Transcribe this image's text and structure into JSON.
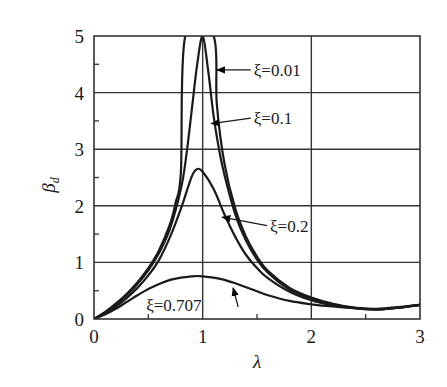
{
  "chart_data": {
    "type": "line",
    "title": "",
    "xlabel": "λ",
    "ylabel": "β_d",
    "xlim": [
      0,
      3
    ],
    "ylim": [
      0,
      5
    ],
    "x_ticks": [
      "0",
      "1",
      "2",
      "3"
    ],
    "y_ticks": [
      "0",
      "1",
      "2",
      "3",
      "4",
      "5"
    ],
    "x_minor_ticks": [
      0.5,
      1.5,
      2.5
    ],
    "y_minor_ticks": [
      0.5,
      1.5,
      2.5,
      3.5,
      4.5
    ],
    "grid": {
      "x": [
        1,
        2
      ],
      "y": [
        1,
        2,
        3,
        4
      ]
    },
    "legend_position": "inline annotations with arrows",
    "series": [
      {
        "name": "ξ=0.01",
        "x": [
          0,
          0.1,
          0.2,
          0.3,
          0.4,
          0.5,
          0.6,
          0.7,
          0.75,
          0.8,
          0.84,
          1.1,
          1.13,
          1.2,
          1.3,
          1.4,
          1.5,
          1.6,
          1.8,
          2.0,
          2.2,
          2.4,
          2.6,
          2.8,
          3.0
        ],
        "y": [
          0,
          0.12,
          0.27,
          0.44,
          0.65,
          0.9,
          1.22,
          1.68,
          2.05,
          2.6,
          5.0,
          5.0,
          3.8,
          2.75,
          1.95,
          1.45,
          1.1,
          0.85,
          0.55,
          0.38,
          0.27,
          0.2,
          0.17,
          0.2,
          0.25
        ]
      },
      {
        "name": "ξ=0.1",
        "x": [
          0,
          0.1,
          0.2,
          0.3,
          0.4,
          0.5,
          0.6,
          0.7,
          0.8,
          0.85,
          0.9,
          0.95,
          1.0,
          1.05,
          1.1,
          1.15,
          1.2,
          1.3,
          1.4,
          1.5,
          1.6,
          1.8,
          2.0,
          2.2,
          2.4,
          2.6,
          2.8,
          3.0
        ],
        "y": [
          0,
          0.11,
          0.25,
          0.42,
          0.62,
          0.86,
          1.17,
          1.6,
          2.3,
          2.9,
          3.7,
          4.5,
          5.0,
          4.4,
          3.6,
          3.0,
          2.55,
          1.85,
          1.38,
          1.05,
          0.82,
          0.52,
          0.36,
          0.26,
          0.19,
          0.17,
          0.2,
          0.25
        ]
      },
      {
        "name": "ξ=0.2",
        "x": [
          0,
          0.1,
          0.2,
          0.3,
          0.4,
          0.5,
          0.6,
          0.7,
          0.8,
          0.9,
          0.95,
          1.0,
          1.1,
          1.2,
          1.3,
          1.4,
          1.5,
          1.6,
          1.8,
          2.0,
          2.2,
          2.4,
          2.6,
          2.8,
          3.0
        ],
        "y": [
          0,
          0.1,
          0.22,
          0.37,
          0.55,
          0.77,
          1.05,
          1.45,
          1.95,
          2.52,
          2.65,
          2.6,
          2.3,
          1.85,
          1.45,
          1.13,
          0.9,
          0.72,
          0.48,
          0.33,
          0.24,
          0.19,
          0.17,
          0.2,
          0.25
        ]
      },
      {
        "name": "ξ=0.707",
        "x": [
          0,
          0.1,
          0.2,
          0.3,
          0.4,
          0.5,
          0.6,
          0.7,
          0.8,
          0.9,
          0.95,
          1.0,
          1.1,
          1.2,
          1.3,
          1.4,
          1.5,
          1.6,
          1.8,
          2.0,
          2.2,
          2.4,
          2.6,
          2.8,
          3.0
        ],
        "y": [
          0,
          0.08,
          0.18,
          0.3,
          0.42,
          0.53,
          0.62,
          0.69,
          0.73,
          0.755,
          0.76,
          0.755,
          0.73,
          0.69,
          0.63,
          0.56,
          0.49,
          0.42,
          0.32,
          0.26,
          0.22,
          0.19,
          0.18,
          0.21,
          0.25
        ]
      }
    ],
    "annotations": [
      {
        "text": "ξ=0.01",
        "label_at": [
          1.47,
          4.4
        ],
        "arrow_to": [
          1.13,
          4.4
        ]
      },
      {
        "text": "ξ=0.1",
        "label_at": [
          1.47,
          3.55
        ],
        "arrow_to": [
          1.08,
          3.45
        ]
      },
      {
        "text": "ξ=0.2",
        "label_at": [
          1.62,
          1.65
        ],
        "arrow_to": [
          1.18,
          1.8
        ]
      },
      {
        "text": "ξ=0.707",
        "label_at": [
          0.48,
          0.25
        ],
        "arrow_to": [
          1.28,
          0.55
        ]
      }
    ]
  }
}
